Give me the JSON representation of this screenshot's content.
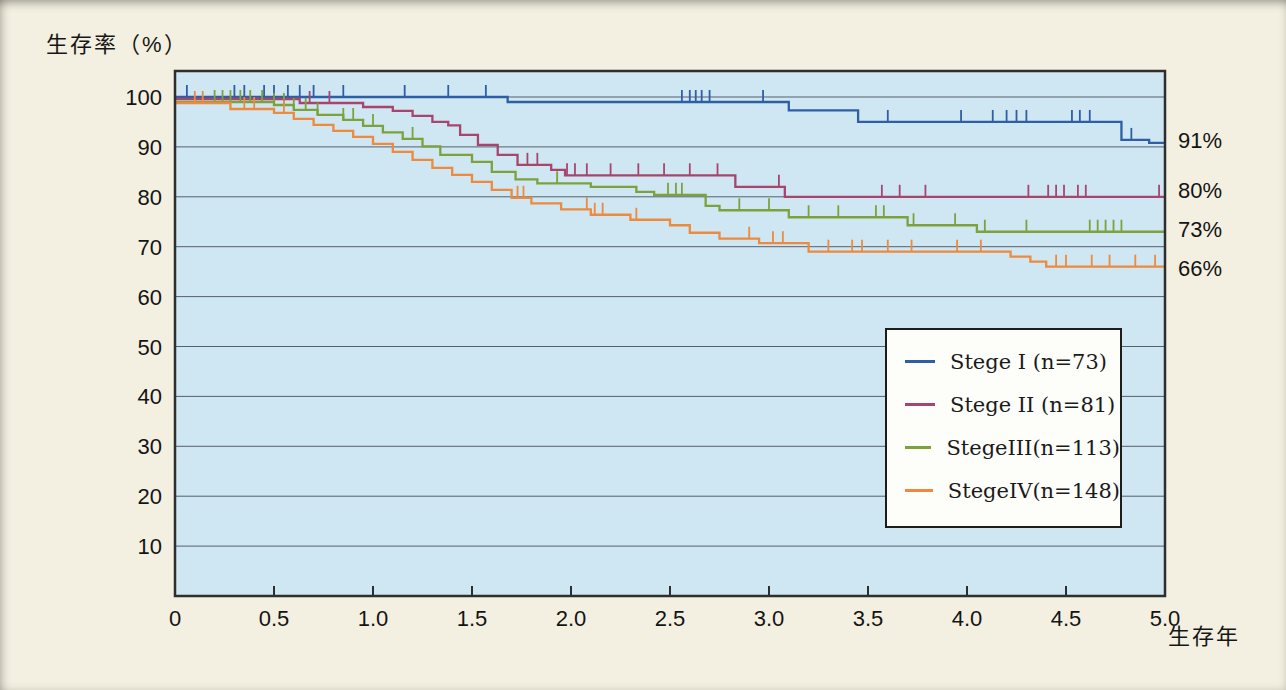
{
  "figure": {
    "title": "生存率（%）",
    "x_axis_label": "生存年"
  },
  "chart_data": {
    "type": "line",
    "subtype": "kaplan-meier-step-survival",
    "title": "生存率（%）",
    "xlabel": "生存年",
    "ylabel": "生存率（%）",
    "xlim": [
      0,
      5
    ],
    "ylim": [
      0,
      100
    ],
    "grid": "horizontal",
    "legend_position": "inside-right-box",
    "plot_bg_color": "#cfe6f3",
    "page_bg_color": "#f3f0e1",
    "grid_color": "#55616b",
    "border_color": "#2e2e2e",
    "x_tick_values": [
      0,
      0.5,
      1.0,
      1.5,
      2.0,
      2.5,
      3.0,
      3.5,
      4.0,
      4.5,
      5.0
    ],
    "x_tick_labels": [
      "0",
      "0.5",
      "1.0",
      "1.5",
      "2.0",
      "2.5",
      "3.0",
      "3.5",
      "4.0",
      "4.5",
      "5.0"
    ],
    "y_tick_values": [
      100,
      90,
      80,
      70,
      60,
      50,
      40,
      30,
      20,
      10
    ],
    "y_tick_labels": [
      "100",
      "90",
      "80",
      "70",
      "60",
      "50",
      "40",
      "30",
      "20",
      "10"
    ],
    "series": [
      {
        "id": "stage-1",
        "label": "Stege I (n=73)",
        "n": 73,
        "color": "#2e5fa5",
        "end_label": "91%",
        "final_value": 91,
        "steps": [
          [
            0,
            100
          ],
          [
            1.68,
            99
          ],
          [
            3.1,
            97.3
          ],
          [
            3.45,
            95
          ],
          [
            4.78,
            91.4
          ],
          [
            4.92,
            90.8
          ],
          [
            5,
            90.8
          ]
        ],
        "censor_ticks": [
          0.06,
          0.3,
          0.35,
          0.45,
          0.5,
          0.57,
          0.63,
          0.7,
          0.85,
          1.16,
          1.38,
          1.57,
          2.56,
          2.6,
          2.63,
          2.66,
          2.7,
          2.97,
          3.6,
          3.97,
          4.13,
          4.2,
          4.25,
          4.3,
          4.53,
          4.57,
          4.62,
          4.83
        ]
      },
      {
        "id": "stage-2",
        "label": "Stege II (n=81)",
        "n": 81,
        "color": "#a8456f",
        "end_label": "80%",
        "final_value": 80,
        "steps": [
          [
            0,
            99.6
          ],
          [
            0.63,
            98.8
          ],
          [
            0.95,
            98
          ],
          [
            1.1,
            97.2
          ],
          [
            1.2,
            96.2
          ],
          [
            1.3,
            95
          ],
          [
            1.38,
            94.3
          ],
          [
            1.44,
            92.4
          ],
          [
            1.53,
            90.4
          ],
          [
            1.63,
            88.4
          ],
          [
            1.73,
            86.4
          ],
          [
            1.9,
            85.4
          ],
          [
            1.97,
            84.3
          ],
          [
            2.83,
            82
          ],
          [
            3.08,
            80
          ],
          [
            5,
            80
          ]
        ],
        "censor_ticks": [
          0.68,
          0.78,
          1.78,
          1.83,
          1.98,
          2.02,
          2.08,
          2.2,
          2.34,
          2.47,
          2.6,
          2.74,
          3.05,
          3.57,
          3.66,
          3.79,
          4.31,
          4.41,
          4.45,
          4.49,
          4.56,
          4.6,
          4.97
        ]
      },
      {
        "id": "stage-3",
        "label": "StegeIII(n=113)",
        "n": 113,
        "color": "#7da23b",
        "end_label": "73%",
        "final_value": 73,
        "steps": [
          [
            0,
            99
          ],
          [
            0.5,
            98.4
          ],
          [
            0.6,
            97.4
          ],
          [
            0.72,
            96.4
          ],
          [
            0.85,
            95.4
          ],
          [
            0.95,
            94.2
          ],
          [
            1.05,
            92.9
          ],
          [
            1.15,
            91.6
          ],
          [
            1.25,
            90.1
          ],
          [
            1.34,
            88.4
          ],
          [
            1.5,
            87
          ],
          [
            1.6,
            85
          ],
          [
            1.72,
            83.5
          ],
          [
            1.83,
            82.7
          ],
          [
            2.1,
            82
          ],
          [
            2.33,
            81
          ],
          [
            2.42,
            80.4
          ],
          [
            2.68,
            78.2
          ],
          [
            2.75,
            77.3
          ],
          [
            3.1,
            75.9
          ],
          [
            3.7,
            74.3
          ],
          [
            4.05,
            73
          ],
          [
            5,
            73
          ]
        ],
        "censor_ticks": [
          0.2,
          0.24,
          0.28,
          0.33,
          0.38,
          0.44,
          0.5,
          0.55,
          0.6,
          0.66,
          0.72,
          0.85,
          0.9,
          1.0,
          1.2,
          1.93,
          2.49,
          2.53,
          2.56,
          2.85,
          3.0,
          3.2,
          3.35,
          3.54,
          3.58,
          3.73,
          3.94,
          4.09,
          4.3,
          4.62,
          4.66,
          4.7,
          4.74,
          4.78
        ]
      },
      {
        "id": "stage-4",
        "label": "StegeIV(n=148)",
        "n": 148,
        "color": "#ee8a3d",
        "end_label": "66%",
        "final_value": 66,
        "steps": [
          [
            0,
            98.8
          ],
          [
            0.28,
            97.6
          ],
          [
            0.5,
            96.8
          ],
          [
            0.6,
            95.6
          ],
          [
            0.7,
            94.4
          ],
          [
            0.8,
            93.2
          ],
          [
            0.9,
            92
          ],
          [
            1.0,
            90.6
          ],
          [
            1.1,
            89
          ],
          [
            1.2,
            87.4
          ],
          [
            1.3,
            85.8
          ],
          [
            1.4,
            84.4
          ],
          [
            1.5,
            83
          ],
          [
            1.6,
            81.4
          ],
          [
            1.7,
            79.8
          ],
          [
            1.8,
            78.7
          ],
          [
            1.95,
            77.5
          ],
          [
            2.1,
            76.4
          ],
          [
            2.3,
            75.4
          ],
          [
            2.5,
            74.3
          ],
          [
            2.6,
            72.8
          ],
          [
            2.75,
            71.6
          ],
          [
            2.95,
            70.7
          ],
          [
            3.2,
            69
          ],
          [
            4.22,
            68
          ],
          [
            4.32,
            67
          ],
          [
            4.4,
            66
          ],
          [
            5,
            66
          ]
        ],
        "censor_ticks": [
          0.1,
          0.14,
          0.35,
          0.4,
          0.55,
          1.73,
          1.76,
          2.08,
          2.12,
          2.16,
          2.33,
          2.9,
          3.02,
          3.07,
          3.3,
          3.42,
          3.47,
          3.6,
          3.72,
          3.95,
          4.07,
          4.45,
          4.5,
          4.63,
          4.72,
          4.85,
          4.95
        ]
      }
    ]
  }
}
